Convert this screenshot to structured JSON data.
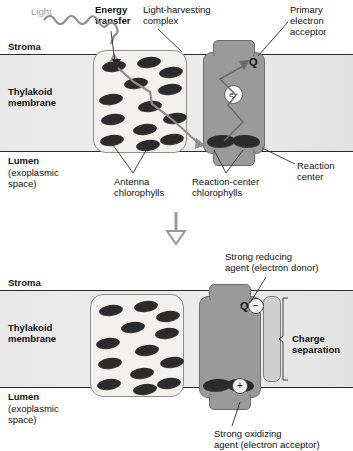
{
  "figure": {
    "colors": {
      "membrane_fill": "#e8e8e8",
      "membrane_border": "#2c2c2c",
      "lhc_fill": "#f2f1ee",
      "lhc_border": "#8d8d8d",
      "reaction_center_fill": "#9a9a9a",
      "reaction_center_border": "#6d6d6d",
      "chlorophyll_fill": "#2b2b2b",
      "light_arrow": "#9a9a9a",
      "energy_arrow": "#8f8f8f",
      "electron_arrow": "#6a6a6a",
      "text": "#111111",
      "light_label_text": "#9a9a9a"
    }
  },
  "panel_top": {
    "labels": {
      "light": "Light",
      "energy_transfer": "Energy\ntransfer",
      "light_harvesting_complex": "Light-harvesting\ncomplex",
      "primary_electron_acceptor": "Primary\nelectron\nacceptor",
      "stroma": "Stroma",
      "thylakoid_membrane": "Thylakoid\nmembrane",
      "lumen": "Lumen",
      "lumen_sub": "(exoplasmic\nspace)",
      "antenna_chlorophylls": "Antenna\nchlorophylls",
      "reaction_center_chlorophylls": "Reaction-center\nchlorophylls",
      "reaction_center": "Reaction\ncenter",
      "quinone": "Q",
      "electron": "e",
      "electron_charge": "−"
    },
    "antenna_chlorophyll_count": 13,
    "reaction_center_chlorophyll_count": 2
  },
  "transition": {
    "arrow": "down-arrow"
  },
  "panel_bottom": {
    "labels": {
      "strong_reducing_agent": "Strong reducing\nagent (electron donor)",
      "strong_oxidizing_agent": "Strong oxidizing\nagent (electron acceptor)",
      "charge_separation": "Charge\nseparation",
      "stroma": "Stroma",
      "thylakoid_membrane": "Thylakoid\nmembrane",
      "lumen": "Lumen",
      "lumen_sub": "(exoplasmic\nspace)",
      "quinone": "Q",
      "quinone_charge": "−",
      "hole_charge": "+"
    },
    "antenna_chlorophyll_count": 13,
    "reaction_center_chlorophyll_count": 2
  }
}
